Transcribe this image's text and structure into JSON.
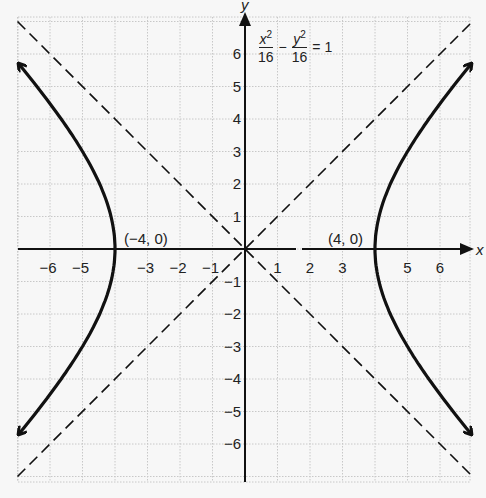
{
  "chart_data": {
    "type": "line",
    "title": "",
    "equation": {
      "x_term_num": "x",
      "y_term_num": "y",
      "exp": "2",
      "den_x": "16",
      "den_y": "16",
      "minus": "−",
      "equals": "= 1",
      "full": "x^2/16 − y^2/16 = 1"
    },
    "xlabel": "x",
    "ylabel": "y",
    "xlim": [
      -7,
      7
    ],
    "ylim": [
      -7,
      7
    ],
    "grid": true,
    "x_tick_labels": [
      "−6",
      "−5",
      "−3",
      "−2",
      "−1",
      "1",
      "2",
      "3",
      "5",
      "6"
    ],
    "x_tick_values": [
      -6,
      -5,
      -3,
      -2,
      -1,
      1,
      2,
      3,
      5,
      6
    ],
    "y_tick_labels": [
      "6",
      "5",
      "4",
      "3",
      "2",
      "1",
      "−1",
      "−2",
      "−3",
      "−4",
      "−5",
      "−6"
    ],
    "y_tick_values": [
      6,
      5,
      4,
      3,
      2,
      1,
      -1,
      -2,
      -3,
      -4,
      -5,
      -6
    ],
    "series": [
      {
        "name": "hyperbola right branch",
        "style": "solid",
        "equation": "x = sqrt(16 + y^2)",
        "points": [
          [
            6.8,
            -5.5
          ],
          [
            6,
            -4.47
          ],
          [
            5,
            -3
          ],
          [
            4.5,
            -2.06
          ],
          [
            4,
            0
          ],
          [
            4.5,
            2.06
          ],
          [
            5,
            3
          ],
          [
            6,
            4.47
          ],
          [
            6.8,
            5.5
          ]
        ]
      },
      {
        "name": "hyperbola left branch",
        "style": "solid",
        "equation": "x = -sqrt(16 + y^2)",
        "points": [
          [
            -6.8,
            5.5
          ],
          [
            -6,
            4.47
          ],
          [
            -5,
            3
          ],
          [
            -4.5,
            2.06
          ],
          [
            -4,
            0
          ],
          [
            -4.5,
            -2.06
          ],
          [
            -5,
            -3
          ],
          [
            -6,
            -4.47
          ],
          [
            -6.8,
            -5.5
          ]
        ]
      },
      {
        "name": "asymptote y = x",
        "style": "dashed",
        "points": [
          [
            -7,
            -7
          ],
          [
            7,
            7
          ]
        ]
      },
      {
        "name": "asymptote y = -x",
        "style": "dashed",
        "points": [
          [
            -7,
            7
          ],
          [
            7,
            -7
          ]
        ]
      }
    ],
    "annotations": [
      {
        "text": "(−4, 0)",
        "x": -4,
        "y": 0
      },
      {
        "text": "(4, 0)",
        "x": 4,
        "y": 0
      }
    ]
  }
}
